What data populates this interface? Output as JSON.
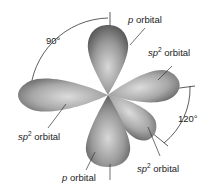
{
  "figure": {
    "watermark": "",
    "labels": {
      "p_top": {
        "italic": "p",
        "text": " orbital"
      },
      "p_bottom": {
        "italic": "p",
        "text": " orbital"
      },
      "sp2_right": {
        "italic": "sp",
        "sup": "2",
        "text": " orbital"
      },
      "sp2_left": {
        "italic": "sp",
        "sup": "2",
        "text": " orbital"
      },
      "sp2_lower": {
        "italic": "sp",
        "sup": "2",
        "text": " orbital"
      }
    },
    "angles": {
      "left_top": "90°",
      "right": "120°"
    },
    "colors": {
      "lobe_dark": "#5a5a5a",
      "lobe_light": "#d9d9d9",
      "line": "#333333"
    }
  }
}
